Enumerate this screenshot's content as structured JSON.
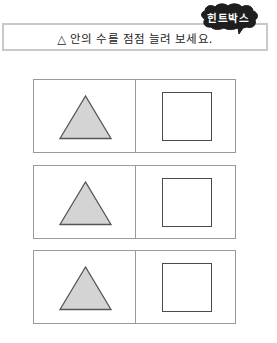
{
  "hint_badge": {
    "label": "힌트박스",
    "icon": "speech-cloud-icon",
    "color": "#1e1e1e",
    "text_color": "#ffffff"
  },
  "instruction": {
    "text": "△ 안의 수를 점점 늘려 보세요."
  },
  "problems": [
    {
      "id": 1,
      "left_cell": {
        "shape": "triangle",
        "fill": "#d4d4d4",
        "stroke": "#555555",
        "content": ""
      },
      "right_cell": {
        "shape": "square",
        "stroke": "#4a4a4a",
        "content": ""
      }
    },
    {
      "id": 2,
      "left_cell": {
        "shape": "triangle",
        "fill": "#d4d4d4",
        "stroke": "#555555",
        "content": ""
      },
      "right_cell": {
        "shape": "square",
        "stroke": "#4a4a4a",
        "content": ""
      }
    },
    {
      "id": 3,
      "left_cell": {
        "shape": "triangle",
        "fill": "#d4d4d4",
        "stroke": "#555555",
        "content": ""
      },
      "right_cell": {
        "shape": "square",
        "stroke": "#4a4a4a",
        "content": ""
      }
    }
  ],
  "colors": {
    "border": "#9a9a9a",
    "instruction_border": "#c9c9c9",
    "background": "#ffffff"
  }
}
